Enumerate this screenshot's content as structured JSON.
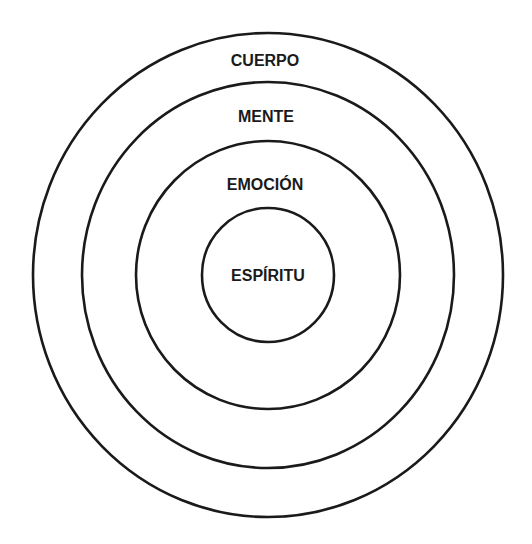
{
  "diagram": {
    "type": "concentric-circles",
    "stroke_color": "#1a1a1a",
    "background_color": "#ffffff",
    "rings": [
      {
        "label": "CUERPO",
        "cx": 268,
        "cy": 275,
        "rx": 235,
        "ry": 242,
        "label_x": 265,
        "label_y": 60
      },
      {
        "label": "MENTE",
        "cx": 268,
        "cy": 275,
        "rx": 186,
        "ry": 193,
        "label_x": 266,
        "label_y": 116
      },
      {
        "label": "EMOCIÓN",
        "cx": 268,
        "cy": 275,
        "rx": 132,
        "ry": 134,
        "label_x": 265,
        "label_y": 184
      },
      {
        "label": "ESPÍRITU",
        "cx": 268,
        "cy": 275,
        "rx": 66,
        "ry": 67,
        "label_x": 268,
        "label_y": 275
      }
    ]
  }
}
